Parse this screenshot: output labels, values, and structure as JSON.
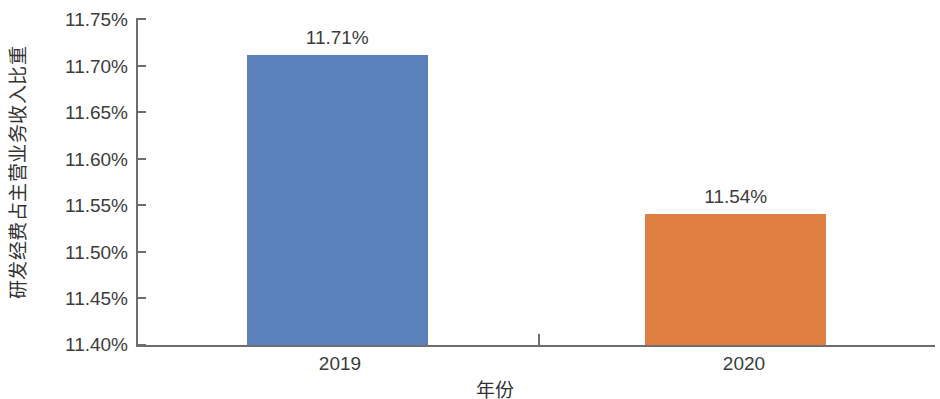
{
  "chart_data": {
    "type": "bar",
    "title": "",
    "subtitle": "",
    "xlabel": "年份",
    "ylabel": "研发经费占主营业务收入比重",
    "categories": [
      "2019",
      "2020"
    ],
    "values": [
      11.71,
      11.54
    ],
    "value_labels": [
      "11.71%",
      "11.54%"
    ],
    "series": [
      {
        "name": "研发经费占主营业务收入比重",
        "values": [
          11.71,
          11.54
        ]
      }
    ],
    "ylim": [
      11.4,
      11.75
    ],
    "ytick_values": [
      11.75,
      11.7,
      11.65,
      11.6,
      11.55,
      11.5,
      11.45,
      11.4
    ],
    "ytick_labels": [
      "11.75%",
      "11.70%",
      "11.65%",
      "11.60%",
      "11.55%",
      "11.50%",
      "11.45%",
      "11.40%"
    ],
    "grid": false,
    "legend": "none",
    "bar_colors": [
      "#5b82bb",
      "#df7f42"
    ],
    "axis_color": "#6e6e6e",
    "text_color": "#3c3c3c",
    "background": "#ffffff"
  }
}
